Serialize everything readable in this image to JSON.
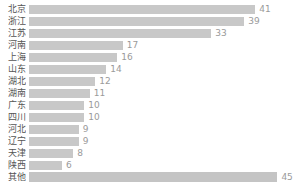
{
  "chart_data": {
    "type": "bar",
    "orientation": "horizontal",
    "title": "",
    "subtitle": "",
    "xlabel": "",
    "ylabel": "",
    "grid": false,
    "legend": null,
    "axis_visible": false,
    "xlim": [
      0,
      45
    ],
    "categories": [
      "北京",
      "浙江",
      "江苏",
      "河南",
      "上海",
      "山东",
      "湖北",
      "湖南",
      "广东",
      "四川",
      "河北",
      "辽宁",
      "天津",
      "陕西",
      "其他"
    ],
    "values": [
      41,
      39,
      33,
      17,
      16,
      14,
      12,
      11,
      10,
      10,
      9,
      9,
      8,
      6,
      45
    ],
    "value_labels": [
      "41",
      "39",
      "33",
      "17",
      "16",
      "14",
      "12",
      "11",
      "10",
      "10",
      "9",
      "9",
      "8",
      "6",
      "45"
    ],
    "colors": {
      "bar": "#c8c8c8",
      "bar_last": "#c4c4c4",
      "category_label": "#555555",
      "value_label": "#9a9a9a",
      "background": "#ffffff"
    },
    "rows": [
      {
        "category": "北京",
        "value": 41,
        "label": "41"
      },
      {
        "category": "浙江",
        "value": 39,
        "label": "39"
      },
      {
        "category": "江苏",
        "value": 33,
        "label": "33"
      },
      {
        "category": "河南",
        "value": 17,
        "label": "17"
      },
      {
        "category": "上海",
        "value": 16,
        "label": "16"
      },
      {
        "category": "山东",
        "value": 14,
        "label": "14"
      },
      {
        "category": "湖北",
        "value": 12,
        "label": "12"
      },
      {
        "category": "湖南",
        "value": 11,
        "label": "11"
      },
      {
        "category": "广东",
        "value": 10,
        "label": "10"
      },
      {
        "category": "四川",
        "value": 10,
        "label": "10"
      },
      {
        "category": "河北",
        "value": 9,
        "label": "9"
      },
      {
        "category": "辽宁",
        "value": 9,
        "label": "9"
      },
      {
        "category": "天津",
        "value": 8,
        "label": "8"
      },
      {
        "category": "陕西",
        "value": 6,
        "label": "6"
      },
      {
        "category": "其他",
        "value": 45,
        "label": "45"
      }
    ]
  }
}
